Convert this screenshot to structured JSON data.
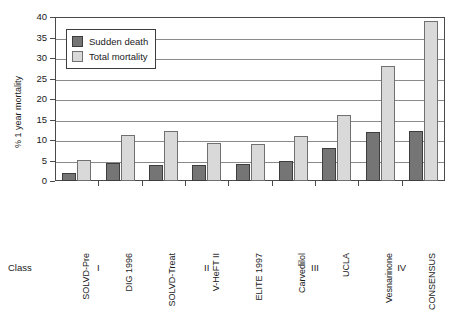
{
  "chart_data": {
    "type": "bar",
    "title": "",
    "xlabel": "",
    "ylabel": "% 1 year mortality",
    "ylim": [
      0,
      40
    ],
    "yticks": [
      0,
      5,
      10,
      15,
      20,
      25,
      30,
      35,
      40
    ],
    "ytick_labels": [
      "0",
      "5",
      "10",
      "15",
      "20",
      "25",
      "30",
      "35",
      "40"
    ],
    "grid": true,
    "legend_position": "upper-left-inside",
    "categories": [
      "SOLVD-Pre",
      "DIG 1996",
      "SOLVD-Treat",
      "V-HeFT II",
      "ELITE 1997",
      "Carvedilol",
      "UCLA",
      "Vesnarinone",
      "CONSENSUS"
    ],
    "series": [
      {
        "name": "Sudden death",
        "color": "#757575",
        "values": [
          2.0,
          4.5,
          3.8,
          3.8,
          4.2,
          5.0,
          8.0,
          12.0,
          12.2
        ]
      },
      {
        "name": "Total mortality",
        "color": "#d9d9d9",
        "values": [
          5.2,
          11.2,
          12.1,
          9.2,
          9.0,
          11.1,
          16.0,
          28.0,
          39.0
        ]
      }
    ],
    "group_axis": {
      "label": "Class",
      "groups": [
        {
          "label": "I",
          "categories": [
            "SOLVD-Pre",
            "DIG 1996"
          ]
        },
        {
          "label": "II",
          "categories": [
            "SOLVD-Treat",
            "V-HeFT II",
            "ELITE 1997"
          ]
        },
        {
          "label": "III",
          "categories": [
            "Carvedilol",
            "UCLA"
          ]
        },
        {
          "label": "IV",
          "categories": [
            "Vesnarinone",
            "CONSENSUS"
          ]
        }
      ]
    }
  }
}
